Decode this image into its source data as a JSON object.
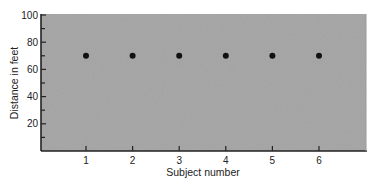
{
  "chart_data": {
    "type": "scatter",
    "title": "",
    "xlabel": "Subject number",
    "ylabel": "Distance in feet",
    "x": [
      1,
      2,
      3,
      4,
      5,
      6
    ],
    "series": [
      {
        "name": "Distance",
        "values": [
          70,
          70,
          70,
          70,
          70,
          70
        ]
      }
    ],
    "xticks": [
      "1",
      "2",
      "3",
      "4",
      "5",
      "6"
    ],
    "yticks": [
      "20",
      "40",
      "60",
      "80",
      "100"
    ],
    "ylim": [
      0,
      100
    ],
    "xlim": [
      0,
      7
    ],
    "grid": false,
    "legend": null,
    "colors": {
      "plot_background": "#a3a3a3",
      "marker": "#111111",
      "axis": "#222222"
    }
  }
}
